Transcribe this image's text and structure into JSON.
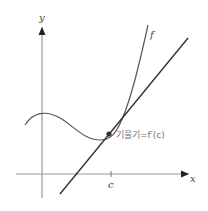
{
  "diagram": {
    "y_axis_label": "y",
    "x_axis_label": "x",
    "curve_label": "f",
    "tick_label": "c",
    "slope_label": "기울기=f′(c)",
    "colors": {
      "axis": "#999999",
      "curve": "#555555",
      "tangent": "#333333",
      "point": "#333333",
      "label": "#777777"
    }
  }
}
